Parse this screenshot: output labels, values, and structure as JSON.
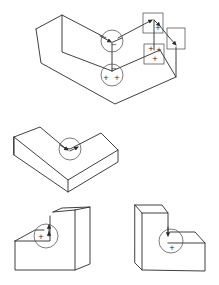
{
  "diagram": {
    "figures": [
      {
        "id": "top-figure",
        "description": "Concave L-shaped block with labeled edges and junctions",
        "junction_labels": [
          {
            "shape": "circle",
            "labels": [
              "−"
            ]
          },
          {
            "shape": "circle",
            "labels": [
              "−",
              "+",
              "+"
            ]
          },
          {
            "shape": "square",
            "labels": [
              "+"
            ]
          },
          {
            "shape": "square",
            "labels": []
          },
          {
            "shape": "square",
            "labels": [
              "+",
              "+",
              "+"
            ]
          }
        ]
      },
      {
        "id": "middle-figure",
        "description": "L-shaped block with circled concave junction",
        "junction_labels": [
          {
            "shape": "circle",
            "labels": []
          }
        ]
      },
      {
        "id": "bottom-left-figure",
        "description": "Step block with circled junction",
        "junction_labels": [
          {
            "shape": "circle",
            "labels": [
              "+"
            ]
          }
        ]
      },
      {
        "id": "bottom-right-figure",
        "description": "Step block with circled junction",
        "junction_labels": [
          {
            "shape": "circle",
            "labels": [
              "+"
            ]
          }
        ]
      }
    ]
  },
  "labels": {
    "minus": "−",
    "plus": "+"
  }
}
